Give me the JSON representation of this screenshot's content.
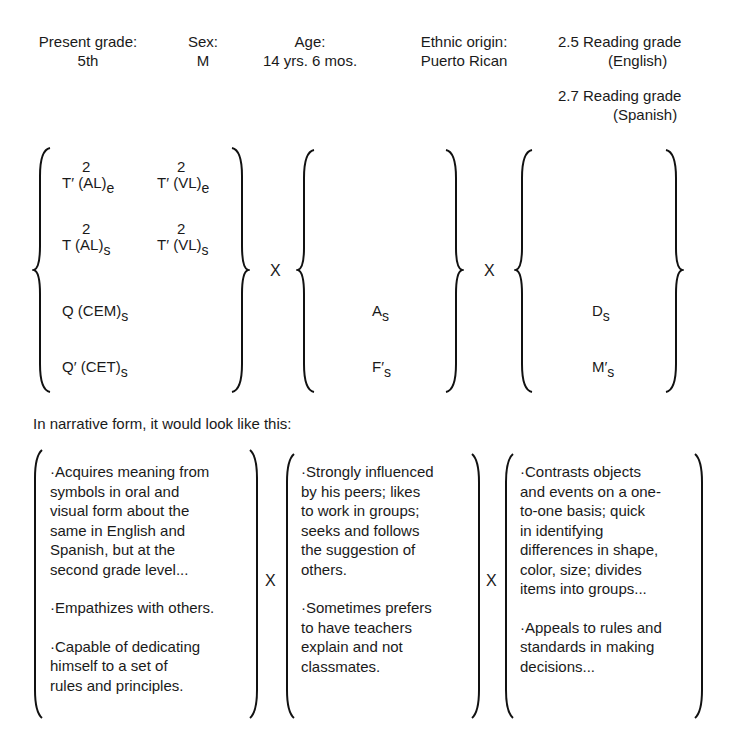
{
  "profile": {
    "present_grade": {
      "label": "Present grade:",
      "value": "5th"
    },
    "sex": {
      "label": "Sex:",
      "value": "M"
    },
    "age": {
      "label": "Age:",
      "value": "14 yrs. 6 mos."
    },
    "ethnic_origin": {
      "label": "Ethnic origin:",
      "value": "Puerto Rican"
    },
    "reading_english": {
      "line1": "2.5 Reading grade",
      "line2": "(English)"
    },
    "reading_spanish": {
      "line1": "2.7 Reading grade",
      "line2": "(Spanish)"
    }
  },
  "formula": {
    "operator": "X",
    "set1": {
      "t1": {
        "sup": "2",
        "base": "T′ (AL)",
        "sub": "e"
      },
      "t2": {
        "sup": "2",
        "base": "T′ (VL)",
        "sub": "e"
      },
      "t3": {
        "sup": "2",
        "base": "T (AL)",
        "sub": "s"
      },
      "t4": {
        "sup": "2",
        "base": "T′ (VL)",
        "sub": "s"
      },
      "t5": {
        "base": "Q (CEM)",
        "sub": "s"
      },
      "t6": {
        "base": "Q′ (CET)",
        "sub": "s"
      }
    },
    "set2": {
      "t1": {
        "base": "A",
        "sub": "s"
      },
      "t2": {
        "base": "F′",
        "sub": "s"
      }
    },
    "set3": {
      "t1": {
        "base": "D",
        "sub": "s"
      },
      "t2": {
        "base": "M′",
        "sub": "s"
      }
    }
  },
  "narrative": {
    "intro": "In narrative form, it would look like this:",
    "operator": "X",
    "col1": [
      [
        "·Acquires meaning from",
        "symbols in oral and",
        "visual form about the",
        "same in English and",
        "Spanish, but at the",
        "second grade level..."
      ],
      [
        "·Empathizes with others."
      ],
      [
        "·Capable of dedicating",
        "himself to a set of",
        "rules and principles."
      ]
    ],
    "col2": [
      [
        "·Strongly influenced",
        "by his peers; likes",
        "to work in groups;",
        "seeks and follows",
        "the suggestion of",
        "others."
      ],
      [
        "·Sometimes prefers",
        "to have teachers",
        "explain and not",
        "classmates."
      ]
    ],
    "col3": [
      [
        "·Contrasts objects",
        "and events on a one-",
        "to-one basis; quick",
        "in identifying",
        "differences in shape,",
        "color, size; divides",
        "items into groups..."
      ],
      [
        "·Appeals to rules and",
        "standards in making",
        "decisions..."
      ]
    ]
  }
}
